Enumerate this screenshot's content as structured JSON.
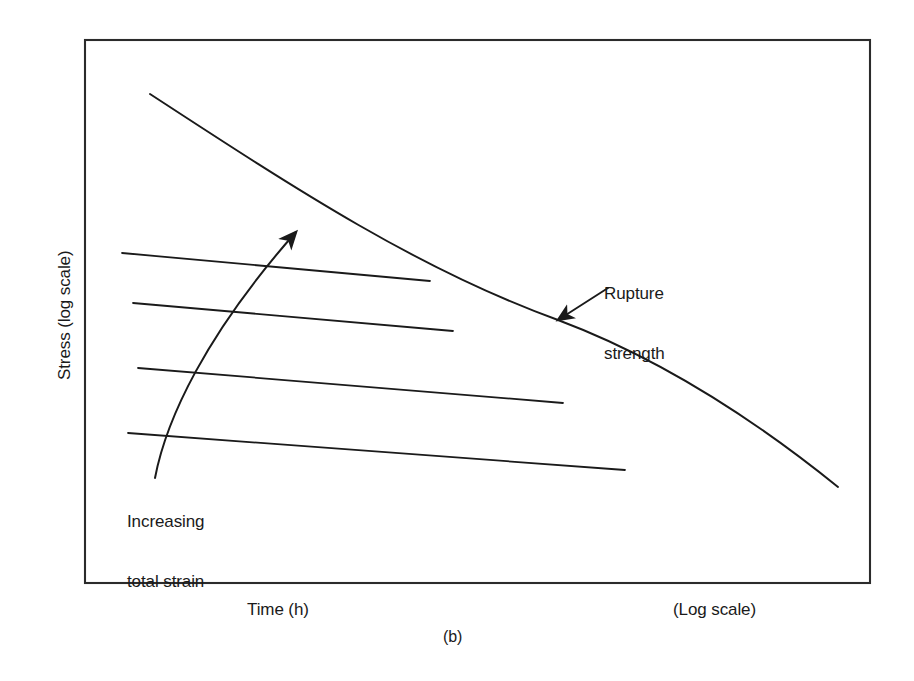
{
  "figure": {
    "caption": "(b)",
    "axes": {
      "y_label": "Stress (log scale)",
      "x_label": "Time (h)",
      "x_scale_note": "(Log scale)"
    },
    "annotations": {
      "rupture": {
        "line1": "Rupture",
        "line2": "strength"
      },
      "strain": {
        "line1": "Increasing",
        "line2": "total strain"
      }
    },
    "colors": {
      "ink": "#1a1a1a",
      "frame": "#2b2b2b",
      "background": "#ffffff"
    }
  },
  "chart_data": {
    "type": "line",
    "title": "",
    "subtitle": "",
    "xlabel": "Time (h)",
    "ylabel": "Stress (log scale)",
    "x_scale": "log",
    "y_scale": "log",
    "grid": false,
    "legend": false,
    "axis_ticks": {
      "x": [],
      "y": []
    },
    "xlim": [
      85,
      870
    ],
    "ylim": [
      40,
      583
    ],
    "note": "Schematic creep diagram: stress versus time on logarithmic axes. Coordinates below are in pixel space of the original 914x681 figure; no numeric tick values are printed on either axis.",
    "plot_frame": {
      "left": 85,
      "top": 40,
      "right": 870,
      "bottom": 583
    },
    "series": [
      {
        "name": "Rupture strength",
        "kind": "rupture-line",
        "points": [
          [
            150,
            94
          ],
          [
            400,
            260
          ],
          [
            558,
            320
          ],
          [
            700,
            400
          ],
          [
            838,
            487
          ]
        ]
      },
      {
        "name": "Isostrain line 1 (lowest total strain)",
        "kind": "isostrain-line",
        "points": [
          [
            122,
            253
          ],
          [
            430,
            281
          ]
        ]
      },
      {
        "name": "Isostrain line 2",
        "kind": "isostrain-line",
        "points": [
          [
            133,
            303
          ],
          [
            453,
            331
          ]
        ]
      },
      {
        "name": "Isostrain line 3",
        "kind": "isostrain-line",
        "points": [
          [
            138,
            368
          ],
          [
            563,
            403
          ]
        ]
      },
      {
        "name": "Isostrain line 4 (highest total strain)",
        "kind": "isostrain-line",
        "points": [
          [
            128,
            433
          ],
          [
            625,
            470
          ]
        ]
      },
      {
        "name": "Increasing total strain arrow",
        "kind": "curved-arrow",
        "points": [
          [
            155,
            472
          ],
          [
            175,
            400
          ],
          [
            230,
            300
          ],
          [
            300,
            226
          ]
        ]
      },
      {
        "name": "Rupture strength leader arrow",
        "kind": "leader-arrow",
        "points": [
          [
            608,
            288
          ],
          [
            558,
            320
          ]
        ]
      }
    ]
  }
}
